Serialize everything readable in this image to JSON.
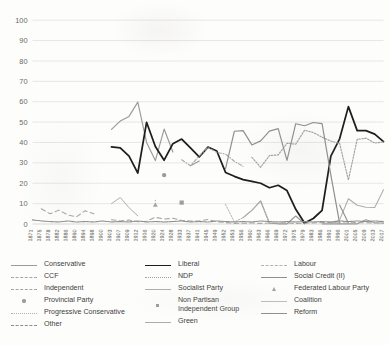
{
  "chart_data": {
    "type": "line",
    "title": "",
    "xlabel": "",
    "ylabel": "",
    "ylim": [
      0,
      100
    ],
    "ytick_step": 10,
    "yticks": [
      0,
      10,
      20,
      30,
      40,
      50,
      60,
      70,
      80,
      90,
      100
    ],
    "grid": true,
    "legend_position": "bottom",
    "legend_columns": 3,
    "categories": [
      "1871",
      "1875",
      "1878",
      "1882",
      "1886",
      "1890",
      "1894",
      "1898",
      "1900",
      "1903",
      "1907",
      "1909",
      "1912",
      "1916",
      "1920",
      "1924",
      "1928",
      "1933",
      "1937",
      "1941",
      "1945",
      "1949",
      "1952",
      "1953",
      "1956",
      "1960",
      "1963",
      "1966",
      "1969",
      "1972",
      "1975",
      "1979",
      "1983",
      "1986",
      "1991",
      "1996",
      "2001",
      "2005",
      "2009",
      "2013",
      "2017"
    ],
    "series": [
      {
        "name": "Conservative",
        "color": "#9a9a96",
        "style": "solid",
        "width": 1.15,
        "values": [
          null,
          null,
          null,
          null,
          null,
          null,
          null,
          null,
          null,
          46.4,
          50.5,
          52.8,
          59.8,
          40.0,
          31.1,
          46.6,
          35.3,
          null,
          28.6,
          30.9,
          null,
          null,
          null,
          null,
          3.1,
          6.7,
          11.3,
          0.4,
          0.1,
          0.1,
          3.9,
          0.1,
          null,
          0.1,
          0.1,
          0.1,
          0.1,
          0.1,
          2.1,
          0.6,
          0.5
        ]
      },
      {
        "name": "Liberal",
        "color": "#1e1e1e",
        "style": "solid",
        "width": 1.75,
        "values": [
          null,
          null,
          null,
          null,
          null,
          null,
          null,
          null,
          null,
          37.8,
          37.4,
          33.3,
          25.0,
          49.9,
          38.0,
          31.3,
          39.4,
          41.7,
          37.3,
          32.9,
          37.7,
          35.8,
          25.3,
          23.4,
          21.8,
          20.9,
          20.0,
          17.8,
          19.0,
          16.4,
          7.2,
          0.5,
          2.7,
          6.7,
          33.3,
          41.8,
          57.6,
          45.8,
          45.8,
          44.1,
          40.4
        ]
      },
      {
        "name": "Labour",
        "color": "#b4b4b0",
        "style": "dashed",
        "width": 1.05,
        "values": [
          null,
          null,
          null,
          null,
          null,
          null,
          null,
          null,
          null,
          null,
          null,
          null,
          null,
          null,
          11.5,
          null,
          null,
          null,
          null,
          null,
          null,
          null,
          null,
          null,
          null,
          null,
          null,
          null,
          null,
          null,
          null,
          null,
          null,
          null,
          null,
          null,
          null,
          null,
          null,
          null,
          null
        ]
      },
      {
        "name": "CCF",
        "color": "#a8a8a4",
        "style": "dashdot",
        "width": 1.1,
        "values": [
          null,
          null,
          null,
          null,
          null,
          null,
          null,
          null,
          null,
          null,
          null,
          null,
          null,
          null,
          null,
          null,
          null,
          31.5,
          28.6,
          33.4,
          37.6,
          35.1,
          34.3,
          30.8,
          28.3,
          null,
          null,
          null,
          null,
          null,
          null,
          null,
          null,
          null,
          null,
          null,
          null,
          null,
          null,
          null,
          null
        ]
      },
      {
        "name": "NDP",
        "color": "#a0a09c",
        "style": "dotted",
        "width": 1.15,
        "values": [
          null,
          null,
          null,
          null,
          null,
          null,
          null,
          null,
          null,
          null,
          null,
          null,
          null,
          null,
          null,
          null,
          null,
          null,
          null,
          null,
          null,
          null,
          null,
          null,
          null,
          32.7,
          27.8,
          33.6,
          33.9,
          39.6,
          39.2,
          46.0,
          44.9,
          42.6,
          40.7,
          39.5,
          21.6,
          41.5,
          42.1,
          39.7,
          40.3
        ]
      },
      {
        "name": "Social Credit (II)",
        "color": "#8f8f8b",
        "style": "solid",
        "width": 1.2,
        "values": [
          null,
          null,
          null,
          null,
          null,
          null,
          null,
          null,
          null,
          null,
          null,
          null,
          null,
          null,
          null,
          null,
          null,
          null,
          null,
          null,
          null,
          null,
          27.2,
          45.5,
          45.8,
          38.8,
          40.8,
          45.6,
          46.8,
          31.2,
          49.2,
          48.2,
          49.8,
          49.3,
          24.0,
          0.4,
          null,
          null,
          null,
          null,
          null
        ]
      },
      {
        "name": "Independent",
        "color": "#a5a5a1",
        "style": "longdash",
        "width": 1.05,
        "values": [
          null,
          7.5,
          5.0,
          6.8,
          4.5,
          3.5,
          6.5,
          5.0,
          null,
          2.1,
          1.5,
          2.0,
          1.1,
          1.4,
          3.3,
          2.4,
          2.8,
          1.7,
          1.5,
          1.5,
          2.2,
          1.1,
          0.7,
          0.3,
          0.4,
          0.5,
          0.3,
          0.5,
          0.4,
          0.6,
          0.2,
          0.4,
          0.5,
          0.7,
          0.8,
          0.9,
          1.0,
          0.7,
          0.6,
          0.5,
          0.4
        ]
      },
      {
        "name": "Socialist Party",
        "color": "#aeaeaa",
        "style": "solid",
        "width": 1.0,
        "values": [
          null,
          null,
          null,
          null,
          null,
          null,
          null,
          null,
          null,
          10.0,
          13.0,
          8.0,
          4.0,
          null,
          null,
          null,
          null,
          null,
          null,
          null,
          null,
          null,
          null,
          null,
          null,
          null,
          null,
          null,
          null,
          null,
          null,
          null,
          null,
          null,
          null,
          null,
          null,
          null,
          null,
          null,
          null
        ]
      },
      {
        "name": "Federated Labour Party",
        "color": "#a3a39f",
        "style": "marker-triangle",
        "width": 1.0,
        "values": [
          null,
          null,
          null,
          null,
          null,
          null,
          null,
          null,
          null,
          null,
          null,
          null,
          null,
          null,
          null,
          null,
          null,
          null,
          null,
          null,
          null,
          null,
          null,
          null,
          null,
          null,
          null,
          null,
          null,
          null,
          null,
          null,
          null,
          null,
          null,
          null,
          null,
          null,
          null,
          null,
          null
        ],
        "marker_points": [
          {
            "x": "1920",
            "y": 9.5
          }
        ]
      },
      {
        "name": "Provincial Party",
        "color": "#9b9b97",
        "style": "marker-dot",
        "width": 1.0,
        "values": [
          null,
          null,
          null,
          null,
          null,
          null,
          null,
          null,
          null,
          null,
          null,
          null,
          null,
          null,
          null,
          null,
          null,
          null,
          null,
          null,
          null,
          null,
          null,
          null,
          null,
          null,
          null,
          null,
          null,
          null,
          null,
          null,
          null,
          null,
          null,
          null,
          null,
          null,
          null,
          null,
          null
        ],
        "marker_points": [
          {
            "x": "1924",
            "y": 24.0
          }
        ]
      },
      {
        "name": "Non Partisan Independent Group",
        "color": "#9d9d99",
        "style": "marker-square",
        "width": 1.0,
        "values": [
          null,
          null,
          null,
          null,
          null,
          null,
          null,
          null,
          null,
          null,
          null,
          null,
          null,
          null,
          null,
          null,
          null,
          null,
          null,
          null,
          null,
          null,
          null,
          null,
          null,
          null,
          null,
          null,
          null,
          null,
          null,
          null,
          null,
          null,
          null,
          null,
          null,
          null,
          null,
          null,
          null
        ],
        "marker_points": [
          {
            "x": "1933",
            "y": 10.5
          }
        ]
      },
      {
        "name": "Coalition",
        "color": "#bdbdb9",
        "style": "solid",
        "width": 1.0,
        "values": [
          null,
          null,
          null,
          null,
          null,
          null,
          null,
          null,
          null,
          null,
          null,
          null,
          null,
          null,
          null,
          null,
          null,
          null,
          null,
          null,
          null,
          null,
          null,
          null,
          null,
          null,
          null,
          null,
          null,
          null,
          null,
          null,
          null,
          null,
          null,
          null,
          null,
          null,
          null,
          null,
          null
        ]
      },
      {
        "name": "Progressive Conservative",
        "color": "#b0b0ac",
        "style": "dotted",
        "width": 1.0,
        "values": [
          null,
          null,
          null,
          null,
          null,
          null,
          null,
          null,
          null,
          null,
          null,
          null,
          null,
          null,
          null,
          null,
          null,
          null,
          null,
          null,
          null,
          null,
          9.6,
          1.0,
          3.1,
          6.7,
          11.3,
          0.4,
          null,
          null,
          null,
          null,
          null,
          null,
          null,
          null,
          null,
          null,
          null,
          null,
          null
        ]
      },
      {
        "name": "Green",
        "color": "#adadaa",
        "style": "solid",
        "width": 1.05,
        "values": [
          null,
          null,
          null,
          null,
          null,
          null,
          null,
          null,
          null,
          null,
          null,
          null,
          null,
          null,
          null,
          null,
          null,
          null,
          null,
          null,
          null,
          null,
          null,
          null,
          null,
          null,
          null,
          null,
          null,
          null,
          null,
          null,
          null,
          null,
          0.1,
          2.0,
          12.4,
          9.2,
          8.2,
          8.1,
          16.8
        ]
      },
      {
        "name": "Reform",
        "color": "#909090",
        "style": "solid",
        "width": 1.1,
        "values": [
          null,
          null,
          null,
          null,
          null,
          null,
          null,
          null,
          null,
          null,
          null,
          null,
          null,
          null,
          null,
          null,
          null,
          null,
          null,
          null,
          null,
          null,
          null,
          null,
          null,
          null,
          null,
          null,
          null,
          null,
          null,
          null,
          null,
          null,
          null,
          9.3,
          0.5,
          null,
          null,
          null,
          null
        ]
      },
      {
        "name": "Other",
        "color": "#8d8d89",
        "style": "densedash",
        "width": 1.1,
        "values": [
          2.0,
          1.5,
          1.2,
          1.0,
          1.5,
          1.0,
          1.2,
          1.0,
          1.5,
          1.0,
          1.2,
          1.0,
          1.5,
          1.0,
          1.2,
          1.0,
          1.2,
          1.5,
          1.0,
          1.2,
          1.0,
          1.5,
          1.2,
          1.0,
          1.2,
          1.0,
          1.5,
          1.2,
          1.0,
          1.2,
          1.0,
          1.2,
          1.0,
          1.2,
          1.0,
          1.5,
          1.2,
          1.5,
          1.2,
          1.5,
          1.2
        ]
      }
    ]
  },
  "legend": {
    "columns": [
      {
        "items": [
          {
            "label": "Conservative",
            "style": "solid",
            "color": "#9a9a96"
          },
          {
            "label": "CCF",
            "style": "dashdot",
            "color": "#a8a8a4"
          },
          {
            "label": "Independent",
            "style": "longdash",
            "color": "#a5a5a1"
          },
          {
            "label": "Provincial Party",
            "style": "marker-dot",
            "color": "#9b9b97"
          },
          {
            "label": "Progressive Conservative",
            "style": "dotted",
            "color": "#b0b0ac"
          },
          {
            "label": "Other",
            "style": "densedash",
            "color": "#8d8d89"
          }
        ]
      },
      {
        "items": [
          {
            "label": "Liberal",
            "style": "solid-thick",
            "color": "#1e1e1e"
          },
          {
            "label": "NDP",
            "style": "dotted",
            "color": "#a0a09c"
          },
          {
            "label": "Socialist Party",
            "style": "solid",
            "color": "#aeaeaa"
          },
          {
            "label": "Non Partisan\nIndependent Group",
            "style": "marker-square",
            "color": "#9d9d99"
          },
          {
            "label": "Green",
            "style": "solid",
            "color": "#adadaa"
          }
        ]
      },
      {
        "items": [
          {
            "label": "Labour",
            "style": "dashed",
            "color": "#b4b4b0"
          },
          {
            "label": "Social Credit (II)",
            "style": "solid",
            "color": "#8f8f8b"
          },
          {
            "label": "Federated Labour Party",
            "style": "marker-triangle",
            "color": "#a3a39f"
          },
          {
            "label": "Coalition",
            "style": "solid",
            "color": "#bdbdb9"
          },
          {
            "label": "Reform",
            "style": "solid",
            "color": "#909090"
          }
        ]
      }
    ]
  }
}
